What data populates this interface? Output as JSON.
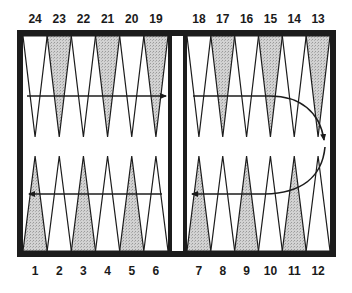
{
  "diagram": {
    "colors": {
      "frame": "#1c1c1c",
      "line": "#1c1c1c",
      "shaded_point": "#c9c9c9",
      "plain_point": "#ffffff",
      "background": "#ffffff"
    },
    "top_labels": [
      "24",
      "23",
      "22",
      "21",
      "20",
      "19",
      "18",
      "17",
      "16",
      "15",
      "14",
      "13"
    ],
    "bottom_labels": [
      "1",
      "2",
      "3",
      "4",
      "5",
      "6",
      "7",
      "8",
      "9",
      "10",
      "11",
      "12"
    ],
    "top_points": [
      {
        "label": "24",
        "shaded": false
      },
      {
        "label": "23",
        "shaded": true
      },
      {
        "label": "22",
        "shaded": false
      },
      {
        "label": "21",
        "shaded": true
      },
      {
        "label": "20",
        "shaded": false
      },
      {
        "label": "19",
        "shaded": true
      },
      {
        "label": "18",
        "shaded": false
      },
      {
        "label": "17",
        "shaded": true
      },
      {
        "label": "16",
        "shaded": false
      },
      {
        "label": "15",
        "shaded": true
      },
      {
        "label": "14",
        "shaded": false
      },
      {
        "label": "13",
        "shaded": true
      }
    ],
    "bottom_points": [
      {
        "label": "1",
        "shaded": true
      },
      {
        "label": "2",
        "shaded": false
      },
      {
        "label": "3",
        "shaded": true
      },
      {
        "label": "4",
        "shaded": false
      },
      {
        "label": "5",
        "shaded": true
      },
      {
        "label": "6",
        "shaded": false
      },
      {
        "label": "7",
        "shaded": true
      },
      {
        "label": "8",
        "shaded": false
      },
      {
        "label": "9",
        "shaded": true
      },
      {
        "label": "10",
        "shaded": false
      },
      {
        "label": "11",
        "shaded": true
      },
      {
        "label": "12",
        "shaded": false
      }
    ],
    "arrows": [
      {
        "name": "arrow-top-left",
        "direction": "right",
        "from_point": "24",
        "to_point": "19"
      },
      {
        "name": "arrow-top-right-curve",
        "direction": "right-then-down",
        "from_point": "18",
        "to_point": "13"
      },
      {
        "name": "arrow-bottom-right-curve",
        "direction": "curve-left",
        "from_point": "12",
        "to_point": "7"
      },
      {
        "name": "arrow-bottom-left",
        "direction": "left",
        "from_point": "6",
        "to_point": "1"
      }
    ]
  }
}
